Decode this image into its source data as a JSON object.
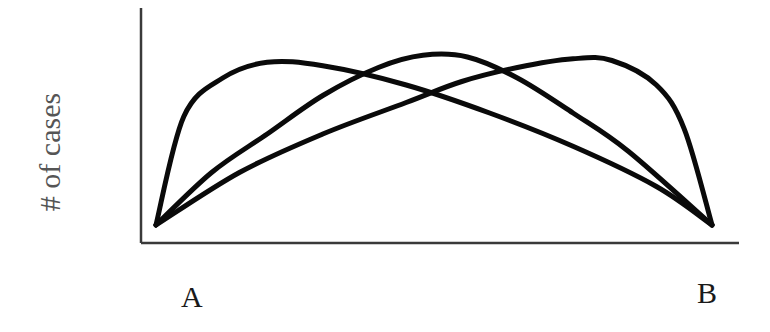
{
  "chart_data": {
    "type": "line",
    "title": "",
    "xlabel": "",
    "ylabel": "# of cases",
    "x_tick_labels": [
      "A",
      "B"
    ],
    "grid": false,
    "legend": null,
    "axes": {
      "x_ticks_shown": false,
      "y_ticks_shown": false
    },
    "series": [
      {
        "name": "peak-near-A",
        "x": [
          0.0,
          0.05,
          0.12,
          0.2,
          0.3,
          0.45,
          0.6,
          0.75,
          0.9,
          1.0
        ],
        "y": [
          0.0,
          0.62,
          0.84,
          0.93,
          0.91,
          0.8,
          0.64,
          0.45,
          0.22,
          0.0
        ]
      },
      {
        "name": "peak-centered",
        "x": [
          0.0,
          0.1,
          0.2,
          0.3,
          0.4,
          0.48,
          0.56,
          0.65,
          0.75,
          0.85,
          1.0
        ],
        "y": [
          0.0,
          0.3,
          0.52,
          0.74,
          0.9,
          0.97,
          0.96,
          0.84,
          0.64,
          0.42,
          0.0
        ]
      },
      {
        "name": "peak-near-B",
        "x": [
          0.0,
          0.15,
          0.3,
          0.45,
          0.55,
          0.65,
          0.75,
          0.82,
          0.9,
          0.95,
          1.0
        ],
        "y": [
          0.0,
          0.3,
          0.52,
          0.7,
          0.82,
          0.9,
          0.95,
          0.94,
          0.8,
          0.55,
          0.0
        ]
      }
    ],
    "ylim": [
      0,
      1
    ],
    "xlim": [
      0,
      1
    ]
  },
  "labels": {
    "y_axis": "# of cases",
    "left_end": "A",
    "right_end": "B"
  },
  "style": {
    "curve_color": "#0a0a0a",
    "axis_color": "#3a3a3a"
  }
}
